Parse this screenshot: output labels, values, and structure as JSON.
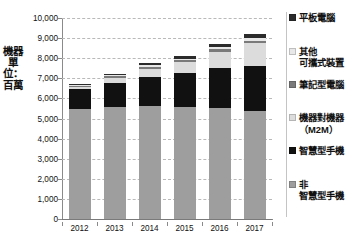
{
  "chart_data": {
    "type": "bar",
    "stacked": true,
    "orientation": "vertical",
    "title": "",
    "subtitle": "",
    "xlabel": "",
    "ylabel": "機器單位：百萬",
    "categories": [
      "2012",
      "2013",
      "2014",
      "2015",
      "2016",
      "2017"
    ],
    "ylim": [
      0,
      10000
    ],
    "ytick_values": [
      0,
      1000,
      2000,
      3000,
      4000,
      5000,
      6000,
      7000,
      8000,
      9000,
      10000
    ],
    "ytick_labels": [
      "0",
      "1,000",
      "2,000",
      "3,000",
      "4,000",
      "5,000",
      "6,000",
      "7,000",
      "8,000",
      "9,000",
      "10,000"
    ],
    "grid": true,
    "grid_style": "dashed",
    "legend_position": "right",
    "series": [
      {
        "name": "非智慧型手機",
        "legend_label": "非\n智慧型手機",
        "color": "#9e9e9e",
        "values": [
          5480,
          5570,
          5640,
          5580,
          5520,
          5350
        ]
      },
      {
        "name": "智慧型手機",
        "legend_label": "智慧型手機",
        "color": "#111111",
        "values": [
          1000,
          1200,
          1420,
          1700,
          1980,
          2270
        ]
      },
      {
        "name": "機器對機器（M2M）",
        "legend_label": "機器對機器\n（M2M）",
        "color": "#dcdcdc",
        "values": [
          90,
          250,
          420,
          510,
          830,
          1130
        ]
      },
      {
        "name": "筆記型電腦",
        "legend_label": "筆記型電腦",
        "color": "#7a7a7a",
        "values": [
          60,
          80,
          95,
          100,
          110,
          120
        ]
      },
      {
        "name": "其他可攜式裝置",
        "legend_label": "其他\n可攜式裝置",
        "color": "#e8e8e8",
        "values": [
          40,
          60,
          75,
          90,
          110,
          130
        ]
      },
      {
        "name": "平板電腦",
        "legend_label": "平板電腦",
        "color": "#2b2b2b",
        "values": [
          30,
          60,
          100,
          140,
          180,
          220
        ]
      }
    ],
    "totals": [
      6700,
      7220,
      7750,
      8120,
      8730,
      9220
    ]
  },
  "axis": {
    "y_title": "機器單位：百萬"
  },
  "legend": {
    "items": [
      {
        "label": "平板電腦",
        "color": "#2b2b2b"
      },
      {
        "label": "其他\n可攜式裝置",
        "color": "#e8e8e8"
      },
      {
        "label": "筆記型電腦",
        "color": "#7a7a7a"
      },
      {
        "label": "機器對機器\n（M2M）",
        "color": "#dcdcdc"
      },
      {
        "label": "智慧型手機",
        "color": "#111111"
      },
      {
        "label": "非\n智慧型手機",
        "color": "#9e9e9e"
      }
    ]
  }
}
